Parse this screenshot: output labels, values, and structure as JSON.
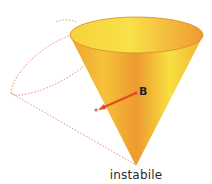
{
  "diagram": {
    "caption": "instabile",
    "point_label": "B",
    "colors": {
      "cone_light": "#f6de3c",
      "cone_mid": "#f4b834",
      "cone_dark": "#e88a2a",
      "rim": "#d98a2a",
      "dashed_outline": "#e08a7a",
      "arrow": "#e04a1c"
    }
  }
}
